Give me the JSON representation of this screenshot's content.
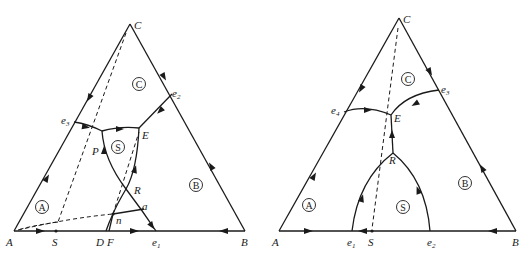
{
  "diagrams": [
    {
      "id": "left",
      "vertices": {
        "A": "A",
        "B": "B",
        "C": "C"
      },
      "base_points": {
        "S": "S",
        "D": "D",
        "F": "F",
        "e1": "e",
        "e1_sub": "1"
      },
      "edge_points": {
        "e2": "e",
        "e2_sub": "2",
        "e3": "e",
        "e3_sub": "3"
      },
      "internal_points": {
        "P": "P",
        "E": "E",
        "R": "R",
        "n": "n",
        "a": "a"
      },
      "fields": {
        "A": "A",
        "B": "B",
        "C": "C",
        "S": "S"
      }
    },
    {
      "id": "right",
      "vertices": {
        "A": "A",
        "B": "B",
        "C": "C"
      },
      "base_points": {
        "e1": "e",
        "e1_sub": "1",
        "S": "S",
        "e2": "e",
        "e2_sub": "2"
      },
      "edge_points": {
        "e3": "e",
        "e3_sub": "3",
        "e4": "e",
        "e4_sub": "4"
      },
      "internal_points": {
        "E": "E",
        "R": "R"
      },
      "fields": {
        "A": "A",
        "B": "B",
        "C": "C",
        "S": "S"
      }
    }
  ]
}
